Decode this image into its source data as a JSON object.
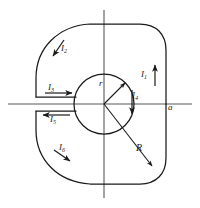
{
  "figure": {
    "type": "physics-diagram",
    "colors": {
      "outline": "#1a1a1a",
      "axis": "#4d4d4d",
      "background": "#ffffff",
      "label": "#1a1a1a"
    },
    "axes": {
      "horizontal": {
        "label": "a",
        "label_position": "right-end",
        "x_start": 8,
        "x_end": 192,
        "y": 104
      },
      "vertical": {
        "label": "",
        "x": 104,
        "y_start": 10,
        "y_end": 198
      },
      "origin": {
        "x": 104,
        "y": 104
      }
    },
    "geometry": {
      "inner_radius_label": "r",
      "inner_radius_px": 30,
      "outer_radius_label": "R",
      "outer_radius_px": 66,
      "slot": {
        "description": "horizontal slot on left side between inner circle and outer boundary",
        "top_edge_y": 97,
        "bottom_edge_y": 111,
        "x_outer": 36,
        "x_inner": 76
      }
    },
    "labels": {
      "i1": {
        "text": "I",
        "sub": "1",
        "arrow": "up",
        "description": "current on right straight edge, flowing upward"
      },
      "i2": {
        "text": "I",
        "sub": "2",
        "arrow": "counterclockwise-down-left",
        "description": "current on upper-left outer arc"
      },
      "i3": {
        "text": "I",
        "sub": "3",
        "arrow": "right",
        "description": "current on upper slot edge, flowing right toward center"
      },
      "i4": {
        "text": "I",
        "sub": "4",
        "arrow": "down",
        "description": "current on inner circle right side, flowing downward"
      },
      "i5": {
        "text": "I",
        "sub": "5",
        "arrow": "left",
        "description": "current on lower slot edge, flowing left away from center"
      },
      "i6": {
        "text": "I",
        "sub": "6",
        "arrow": "clockwise-down-right",
        "description": "current on lower-left outer arc"
      },
      "r_small": {
        "text": "r",
        "description": "inner radius dimension with arrow"
      },
      "R_big": {
        "text": "R",
        "description": "outer radius dimension with arrow"
      },
      "a_axis": {
        "text": "a",
        "description": "horizontal axis name label"
      }
    }
  }
}
